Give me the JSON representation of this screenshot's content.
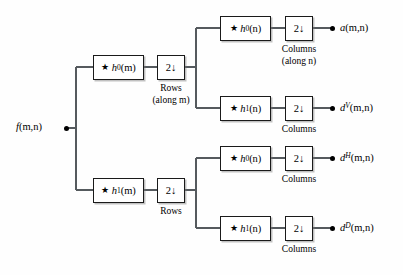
{
  "figure": {
    "background_color": "#fefefe",
    "line_color": "#1a1a1a",
    "text_color": "#000000"
  },
  "input": {
    "label_base": "f",
    "label_args": "(m,n)",
    "name": "input-signal"
  },
  "row_stage": {
    "caption_top": "Rows",
    "caption_top_detail": "(along m)",
    "caption_bottom": "Rows",
    "filters": [
      {
        "star": "★",
        "base": "h",
        "sub": "0",
        "args": "(m)"
      },
      {
        "star": "★",
        "base": "h",
        "sub": "1",
        "args": "(m)"
      }
    ],
    "decimator": "2↓"
  },
  "column_stage": {
    "decimator": "2↓",
    "caption_first": "Columns",
    "caption_first_detail": "(along n)",
    "caption_other": "Columns",
    "branches": [
      {
        "id": "approximation",
        "filter": {
          "star": "★",
          "base": "h",
          "sub": "0",
          "args": "(n)"
        },
        "output": {
          "base": "a",
          "sup": "",
          "args": "(m,n)"
        }
      },
      {
        "id": "vertical-detail",
        "filter": {
          "star": "★",
          "base": "h",
          "sub": "1",
          "args": "(n)"
        },
        "output": {
          "base": "d",
          "sup": "V",
          "args": "(m,n)"
        }
      },
      {
        "id": "horizontal-detail",
        "filter": {
          "star": "★",
          "base": "h",
          "sub": "0",
          "args": "(n)"
        },
        "output": {
          "base": "d",
          "sup": "H",
          "args": "(m,n)"
        }
      },
      {
        "id": "diagonal-detail",
        "filter": {
          "star": "★",
          "base": "h",
          "sub": "1",
          "args": "(n)"
        },
        "output": {
          "base": "d",
          "sup": "D",
          "args": "(m,n)"
        }
      }
    ]
  }
}
